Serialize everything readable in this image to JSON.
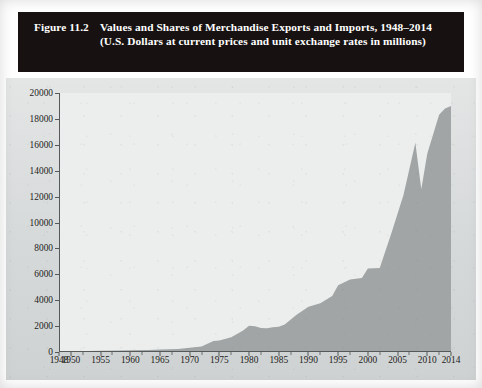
{
  "figure": {
    "number": "Figure 11.2",
    "caption": "Values and Shares of Merchandise Exports and Imports, 1948–2014 (U.S. Dollars at current prices and unit exchange rates in millions)"
  },
  "colors": {
    "title_background": "#171211",
    "title_text": "#ffffff",
    "plate_background": "#d9dcdc",
    "plot_background": "#eceeee",
    "area_fill": "#a2a5a5",
    "axis_line": "#55595a",
    "tick_text": "#1c1b1a"
  },
  "chart_data": {
    "type": "area",
    "title": "Values and Shares of Merchandise Exports and Imports, 1948–2014 (U.S. Dollars at current prices and unit exchange rates in millions)",
    "xlabel": "",
    "ylabel": "",
    "grid": false,
    "legend": "none",
    "xlim": [
      1948,
      2014
    ],
    "ylim": [
      0,
      20000
    ],
    "ytick_step": 2000,
    "yticks": [
      0,
      2000,
      4000,
      6000,
      8000,
      10000,
      12000,
      14000,
      16000,
      18000,
      20000
    ],
    "ytick_labels": [
      "0",
      "2000",
      "4000",
      "6000",
      "8000",
      "10000",
      "12000",
      "14000",
      "16000",
      "18000",
      "20000"
    ],
    "xticks": [
      1948,
      1950,
      1955,
      1960,
      1965,
      1970,
      1975,
      1980,
      1985,
      1990,
      1995,
      2000,
      2005,
      2010,
      2014
    ],
    "xtick_labels": [
      "1948",
      "1950",
      "1955",
      "1960",
      "1965",
      "1970",
      "1975",
      "1980",
      "1985",
      "1990",
      "1995",
      "2000",
      "2005",
      "2010",
      "2014"
    ],
    "x_minor_ticks": [
      1952,
      1957,
      1962,
      1967,
      1972,
      1977,
      1982,
      1987,
      1992,
      1997,
      2002,
      2007,
      2012
    ],
    "series": [
      {
        "name": "Merchandise exports value",
        "x": [
          1948,
          1950,
          1953,
          1955,
          1958,
          1960,
          1963,
          1965,
          1968,
          1970,
          1972,
          1974,
          1975,
          1977,
          1979,
          1980,
          1981,
          1982,
          1983,
          1984,
          1985,
          1986,
          1988,
          1990,
          1992,
          1994,
          1995,
          1997,
          1999,
          2000,
          2002,
          2004,
          2006,
          2008,
          2009,
          2010,
          2012,
          2013,
          2014
        ],
        "values": [
          60,
          65,
          85,
          95,
          110,
          130,
          160,
          190,
          240,
          320,
          420,
          840,
          880,
          1130,
          1660,
          2030,
          1980,
          1850,
          1830,
          1920,
          1950,
          2130,
          2870,
          3490,
          3770,
          4320,
          5160,
          5590,
          5710,
          6450,
          6490,
          9220,
          12130,
          16150,
          12560,
          15300,
          18330,
          18800,
          19000
        ]
      }
    ],
    "units": "U.S. Dollars at current prices in millions"
  }
}
